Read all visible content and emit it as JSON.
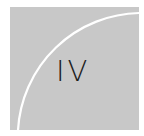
{
  "tile": {
    "numeral": "IV",
    "background_color": "#c8c8c8",
    "arc_color": "#ffffff",
    "text_color": "#1e1e1e"
  }
}
